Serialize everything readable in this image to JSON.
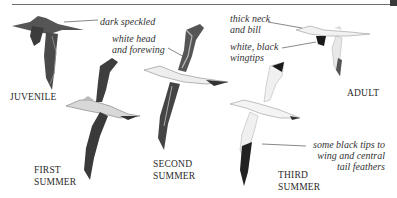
{
  "page": {
    "stages": {
      "juvenile": "JUVENILE",
      "first_summer_1": "FIRST",
      "first_summer_2": "SUMMER",
      "second_summer_1": "SECOND",
      "second_summer_2": "SUMMER",
      "third_summer_1": "THIRD",
      "third_summer_2": "SUMMER",
      "adult": "ADULT"
    },
    "annotations": {
      "dark_speckled": "dark speckled",
      "white_head_1": "white head",
      "white_head_2": "and forewing",
      "thick_neck_1": "thick neck",
      "thick_neck_2": "and bill",
      "white_black_1": "white, black",
      "white_black_2": "wingtips",
      "black_tips_1": "some black tips to",
      "black_tips_2": "wing and central",
      "black_tips_3": "tail feathers"
    },
    "colors": {
      "rule": "#6e6e6e",
      "dark_plumage": "#3c3c3c",
      "mid_plumage": "#7a7a7a",
      "light_plumage": "#e8e8e8",
      "black_tip": "#1a1a1a"
    }
  }
}
